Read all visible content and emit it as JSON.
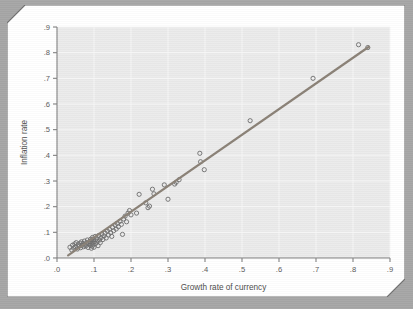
{
  "figure": {
    "background_color": "#a6a6a6",
    "card_color": "#ffffff",
    "plot_background": "#ebebeb",
    "gridline_color": "#f7f7f7",
    "axis_color": "#808080",
    "marker_color": "#707070",
    "line_color": "#8a8176"
  },
  "chart_data": {
    "type": "scatter",
    "title": "",
    "xlabel": "Growth rate of currency",
    "ylabel": "Inflation rate",
    "xlim": [
      0.0,
      0.9
    ],
    "ylim": [
      0.0,
      0.9
    ],
    "xticks": [
      ".0",
      ".1",
      ".2",
      ".3",
      ".4",
      ".5",
      ".6",
      ".7",
      ".8",
      ".9"
    ],
    "yticks": [
      ".0",
      ".1",
      ".2",
      ".3",
      ".4",
      ".5",
      ".6",
      ".7",
      ".8",
      ".9"
    ],
    "xtick_values": [
      0.0,
      0.1,
      0.2,
      0.3,
      0.4,
      0.5,
      0.6,
      0.7,
      0.8,
      0.9
    ],
    "ytick_values": [
      0.0,
      0.1,
      0.2,
      0.3,
      0.4,
      0.5,
      0.6,
      0.7,
      0.8,
      0.9
    ],
    "grid": true,
    "legend": "none",
    "marker": "open-circle",
    "series": [
      {
        "name": "Countries",
        "points": [
          [
            0.035,
            0.042
          ],
          [
            0.04,
            0.031
          ],
          [
            0.042,
            0.05
          ],
          [
            0.045,
            0.038
          ],
          [
            0.048,
            0.055
          ],
          [
            0.05,
            0.044
          ],
          [
            0.052,
            0.06
          ],
          [
            0.055,
            0.035
          ],
          [
            0.057,
            0.052
          ],
          [
            0.06,
            0.046
          ],
          [
            0.062,
            0.058
          ],
          [
            0.064,
            0.04
          ],
          [
            0.066,
            0.063
          ],
          [
            0.068,
            0.05
          ],
          [
            0.07,
            0.056
          ],
          [
            0.072,
            0.044
          ],
          [
            0.074,
            0.066
          ],
          [
            0.076,
            0.053
          ],
          [
            0.078,
            0.047
          ],
          [
            0.08,
            0.06
          ],
          [
            0.082,
            0.07
          ],
          [
            0.084,
            0.041
          ],
          [
            0.086,
            0.055
          ],
          [
            0.088,
            0.064
          ],
          [
            0.09,
            0.049
          ],
          [
            0.091,
            0.073
          ],
          [
            0.092,
            0.058
          ],
          [
            0.093,
            0.038
          ],
          [
            0.094,
            0.068
          ],
          [
            0.095,
            0.046
          ],
          [
            0.096,
            0.08
          ],
          [
            0.097,
            0.061
          ],
          [
            0.098,
            0.052
          ],
          [
            0.099,
            0.071
          ],
          [
            0.1,
            0.042
          ],
          [
            0.101,
            0.063
          ],
          [
            0.103,
            0.084
          ],
          [
            0.105,
            0.057
          ],
          [
            0.107,
            0.075
          ],
          [
            0.109,
            0.066
          ],
          [
            0.111,
            0.048
          ],
          [
            0.113,
            0.088
          ],
          [
            0.115,
            0.07
          ],
          [
            0.117,
            0.06
          ],
          [
            0.119,
            0.079
          ],
          [
            0.121,
            0.093
          ],
          [
            0.124,
            0.072
          ],
          [
            0.127,
            0.086
          ],
          [
            0.13,
            0.097
          ],
          [
            0.133,
            0.078
          ],
          [
            0.136,
            0.105
          ],
          [
            0.139,
            0.09
          ],
          [
            0.142,
            0.112
          ],
          [
            0.145,
            0.099
          ],
          [
            0.148,
            0.084
          ],
          [
            0.15,
            0.12
          ],
          [
            0.153,
            0.106
          ],
          [
            0.157,
            0.128
          ],
          [
            0.16,
            0.113
          ],
          [
            0.163,
            0.135
          ],
          [
            0.166,
            0.122
          ],
          [
            0.17,
            0.143
          ],
          [
            0.174,
            0.131
          ],
          [
            0.177,
            0.092
          ],
          [
            0.18,
            0.152
          ],
          [
            0.184,
            0.163
          ],
          [
            0.188,
            0.141
          ],
          [
            0.192,
            0.175
          ],
          [
            0.196,
            0.185
          ],
          [
            0.2,
            0.168
          ],
          [
            0.215,
            0.175
          ],
          [
            0.222,
            0.248
          ],
          [
            0.24,
            0.215
          ],
          [
            0.246,
            0.196
          ],
          [
            0.25,
            0.202
          ],
          [
            0.258,
            0.268
          ],
          [
            0.262,
            0.25
          ],
          [
            0.29,
            0.285
          ],
          [
            0.3,
            0.229
          ],
          [
            0.318,
            0.288
          ],
          [
            0.322,
            0.295
          ],
          [
            0.33,
            0.305
          ],
          [
            0.386,
            0.408
          ],
          [
            0.388,
            0.375
          ],
          [
            0.398,
            0.344
          ],
          [
            0.522,
            0.535
          ],
          [
            0.692,
            0.7
          ],
          [
            0.815,
            0.831
          ],
          [
            0.84,
            0.82
          ]
        ]
      }
    ],
    "fit_line": {
      "name": "regression-line",
      "x_start": 0.03,
      "y_start": 0.01,
      "x_end": 0.843,
      "y_end": 0.823
    }
  }
}
